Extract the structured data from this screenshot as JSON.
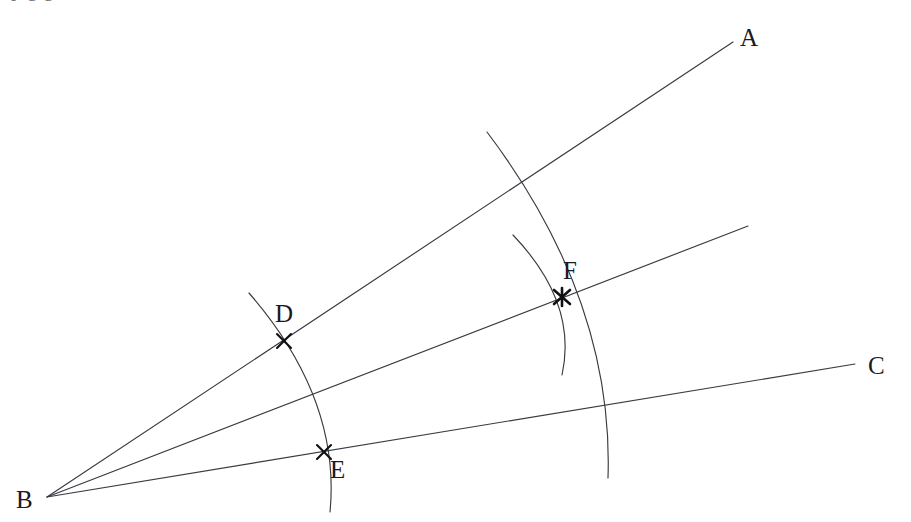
{
  "figure": {
    "canvas": {
      "width": 911,
      "height": 522
    },
    "background_color": "#ffffff",
    "line_color": "#3a3a40",
    "mark_color": "#111114",
    "label_color": "#1a1a1f",
    "clipped_top_text": ", p                 g                                g"
  },
  "labels": {
    "A": "A",
    "B": "B",
    "C": "C",
    "D": "D",
    "E": "E",
    "F": "F"
  },
  "label_positions": {
    "A": {
      "x": 740,
      "y": 25
    },
    "B": {
      "x": 16,
      "y": 487
    },
    "C": {
      "x": 868,
      "y": 353
    },
    "D": {
      "x": 275,
      "y": 301
    },
    "E": {
      "x": 330,
      "y": 457
    },
    "F": {
      "x": 563,
      "y": 258
    }
  },
  "points": {
    "B": {
      "x": 47,
      "y": 497,
      "label": "B",
      "role": "vertex"
    },
    "D": {
      "x": 284,
      "y": 341,
      "label": "D",
      "role": "arc-intersection-on-ray-BA"
    },
    "E": {
      "x": 324,
      "y": 452,
      "label": "E",
      "role": "arc-intersection-on-ray-BC"
    },
    "F": {
      "x": 562,
      "y": 297,
      "label": "F",
      "role": "bisector-intersection"
    }
  },
  "rays": [
    {
      "name": "ray-BA",
      "from": {
        "x": 47,
        "y": 497
      },
      "to": {
        "x": 733,
        "y": 42
      },
      "endpoint_label": "A"
    },
    {
      "name": "ray-bisector",
      "from": {
        "x": 47,
        "y": 497
      },
      "to": {
        "x": 748,
        "y": 226
      },
      "endpoint_label": ""
    },
    {
      "name": "ray-BC",
      "from": {
        "x": 47,
        "y": 497
      },
      "to": {
        "x": 855,
        "y": 364
      },
      "endpoint_label": "C"
    }
  ],
  "arcs": [
    {
      "name": "arc-through-D-and-E",
      "center_point": "B",
      "start": {
        "x": 249,
        "y": 293
      },
      "end": {
        "x": 330,
        "y": 512
      },
      "control": {
        "x": 341,
        "y": 399
      },
      "passes_through": [
        "D",
        "E"
      ]
    },
    {
      "name": "arc-from-D-through-F",
      "center_point": "D",
      "start": {
        "x": 487,
        "y": 132
      },
      "end": {
        "x": 608,
        "y": 478
      },
      "control": {
        "x": 614,
        "y": 300
      },
      "passes_through": [
        "F"
      ]
    },
    {
      "name": "arc-from-E-through-F",
      "center_point": "E",
      "start": {
        "x": 513,
        "y": 235
      },
      "end": {
        "x": 562,
        "y": 375
      },
      "control": {
        "x": 578,
        "y": 303
      },
      "passes_through": [
        "F"
      ]
    }
  ],
  "crossings": [
    {
      "name": "arc-DE-crosses-bisector",
      "x": 310,
      "y": 396
    },
    {
      "name": "arc-D-crosses-ray-BA",
      "x": 522,
      "y": 182
    },
    {
      "name": "arc-D-crosses-ray-BC",
      "x": 606,
      "y": 406
    }
  ]
}
